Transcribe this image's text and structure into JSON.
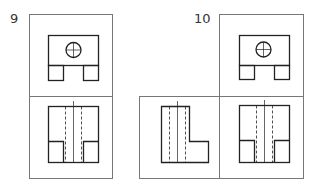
{
  "problems": [
    {
      "number": "9",
      "views": [
        "top-view",
        "front-view"
      ]
    },
    {
      "number": "10",
      "views": [
        "top-view",
        "side-view",
        "front-view"
      ]
    }
  ],
  "colors": {
    "line": "#222222",
    "frame": "#777777",
    "background": "#ffffff"
  }
}
